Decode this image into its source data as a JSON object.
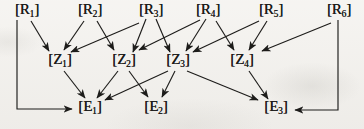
{
  "diagram": {
    "background": "#f3f1ed",
    "ink": "#1d1c1a",
    "nodes": [
      {
        "id": "R1",
        "open": "[",
        "letter": "R",
        "sub": "1",
        "close": "]",
        "x": 27,
        "y": 11
      },
      {
        "id": "R2",
        "open": "[",
        "letter": "R",
        "sub": "2",
        "close": "]",
        "x": 90,
        "y": 11
      },
      {
        "id": "R3",
        "open": "[",
        "letter": "R",
        "sub": "3",
        "close": "]",
        "x": 151,
        "y": 11
      },
      {
        "id": "R4",
        "open": "[",
        "letter": "R",
        "sub": "4",
        "close": "]",
        "x": 208,
        "y": 11
      },
      {
        "id": "R5",
        "open": "[",
        "letter": "R",
        "sub": "5",
        "close": "]",
        "x": 271,
        "y": 11
      },
      {
        "id": "R6",
        "open": "[",
        "letter": "R",
        "sub": "6",
        "close": "]",
        "x": 339,
        "y": 11
      },
      {
        "id": "Z1",
        "open": "[",
        "letter": "Z",
        "sub": "1",
        "close": "]",
        "x": 60,
        "y": 61
      },
      {
        "id": "Z2",
        "open": "[",
        "letter": "Z",
        "sub": "2",
        "close": "]",
        "x": 124,
        "y": 61
      },
      {
        "id": "Z3",
        "open": "[",
        "letter": "Z",
        "sub": "3",
        "close": "]",
        "x": 178,
        "y": 61
      },
      {
        "id": "Z4",
        "open": "[",
        "letter": "Z",
        "sub": "4",
        "close": "]",
        "x": 242,
        "y": 61
      },
      {
        "id": "E1",
        "open": "[",
        "letter": "E",
        "sub": "1",
        "close": "]",
        "x": 90,
        "y": 108
      },
      {
        "id": "E2",
        "open": "[",
        "letter": "E",
        "sub": "2",
        "close": "]",
        "x": 156,
        "y": 108
      },
      {
        "id": "E3",
        "open": "[",
        "letter": "E",
        "sub": "3",
        "close": "]",
        "x": 276,
        "y": 108
      }
    ],
    "edges": [
      {
        "from": "R1",
        "to": "Z1",
        "points": [
          [
            31,
            21
          ],
          [
            49,
            51
          ]
        ]
      },
      {
        "from": "R2",
        "to": "Z1",
        "points": [
          [
            84,
            21
          ],
          [
            64,
            50
          ]
        ]
      },
      {
        "from": "R3",
        "to": "Z1",
        "points": [
          [
            139,
            23
          ],
          [
            71,
            52
          ]
        ]
      },
      {
        "from": "R2",
        "to": "Z2",
        "points": [
          [
            97,
            21
          ],
          [
            114,
            50
          ]
        ]
      },
      {
        "from": "R3",
        "to": "Z2",
        "points": [
          [
            146,
            19
          ],
          [
            133,
            52
          ]
        ]
      },
      {
        "from": "R4",
        "to": "Z2",
        "points": [
          [
            200,
            20
          ],
          [
            139,
            50
          ]
        ]
      },
      {
        "from": "R3",
        "to": "Z3",
        "points": [
          [
            156,
            19
          ],
          [
            170,
            52
          ]
        ]
      },
      {
        "from": "R4",
        "to": "Z3",
        "points": [
          [
            206,
            19
          ],
          [
            186,
            51
          ]
        ]
      },
      {
        "from": "R5",
        "to": "Z3",
        "points": [
          [
            259,
            21
          ],
          [
            193,
            52
          ]
        ]
      },
      {
        "from": "R4",
        "to": "Z4",
        "points": [
          [
            216,
            21
          ],
          [
            234,
            50
          ]
        ]
      },
      {
        "from": "R5",
        "to": "Z4",
        "points": [
          [
            267,
            21
          ],
          [
            249,
            50
          ]
        ]
      },
      {
        "from": "R6",
        "to": "Z4",
        "points": [
          [
            331,
            23
          ],
          [
            262,
            51
          ]
        ]
      },
      {
        "from": "R1",
        "to": "E1",
        "points": [
          [
            17,
            20
          ],
          [
            17,
            109
          ],
          [
            72,
            109
          ]
        ]
      },
      {
        "from": "R6",
        "to": "E3",
        "points": [
          [
            338,
            20
          ],
          [
            338,
            110
          ],
          [
            295,
            110
          ]
        ]
      },
      {
        "from": "Z1",
        "to": "E1",
        "points": [
          [
            64,
            71
          ],
          [
            85,
            98
          ]
        ]
      },
      {
        "from": "Z2",
        "to": "E1",
        "points": [
          [
            118,
            71
          ],
          [
            97,
            98
          ]
        ]
      },
      {
        "from": "Z3",
        "to": "E1",
        "points": [
          [
            168,
            71
          ],
          [
            105,
            100
          ]
        ]
      },
      {
        "from": "Z2",
        "to": "E2",
        "points": [
          [
            129,
            71
          ],
          [
            148,
            97
          ]
        ]
      },
      {
        "from": "Z3",
        "to": "E2",
        "points": [
          [
            175,
            71
          ],
          [
            162,
            97
          ]
        ]
      },
      {
        "from": "Z3",
        "to": "E3",
        "points": [
          [
            187,
            71
          ],
          [
            258,
            100
          ]
        ]
      },
      {
        "from": "Z4",
        "to": "E3",
        "points": [
          [
            249,
            71
          ],
          [
            268,
            99
          ]
        ]
      }
    ]
  }
}
